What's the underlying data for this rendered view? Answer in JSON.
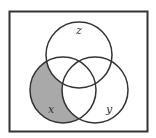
{
  "diagram": {
    "type": "venn",
    "frame": {
      "x": 9,
      "y": 11,
      "width": 139,
      "height": 121,
      "stroke": "#333333"
    },
    "circles": [
      {
        "name": "z",
        "label": "z",
        "cx": 79,
        "cy": 55,
        "r": 33,
        "label_x": 77,
        "label_y": 33
      },
      {
        "name": "x",
        "label": "x",
        "cx": 63,
        "cy": 90,
        "r": 33,
        "label_x": 48,
        "label_y": 112
      },
      {
        "name": "y",
        "label": "y",
        "cx": 95,
        "cy": 90,
        "r": 33,
        "label_x": 107,
        "label_y": 112
      }
    ],
    "shaded_region": "x only (x minus y minus z)",
    "colors": {
      "shade": "#a9a9a9",
      "stroke": "#333333",
      "background": "#ffffff"
    }
  }
}
